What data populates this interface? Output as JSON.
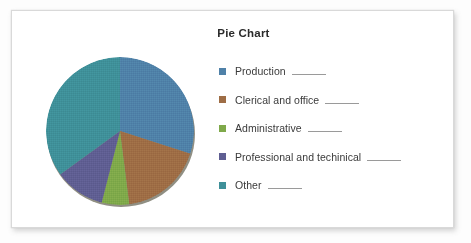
{
  "card": {
    "title": "Pie Chart"
  },
  "legend": {
    "blank": " ",
    "items": [
      {
        "label": "Production",
        "color": "#4F81A8"
      },
      {
        "label": "Clerical and office",
        "color": "#9E6D45"
      },
      {
        "label": "Administrative",
        "color": "#7FA94A"
      },
      {
        "label": "Professional and techinical",
        "color": "#5F5E92"
      },
      {
        "label": "Other",
        "color": "#3F9099"
      }
    ]
  },
  "chart_data": {
    "type": "pie",
    "title": "Pie Chart",
    "xlabel": "",
    "ylabel": "",
    "legend_position": "right",
    "grid": false,
    "start_angle_deg": 0,
    "direction": "clockwise",
    "labels": [
      "Production",
      "Clerical and office",
      "Administrative",
      "Professional and techinical",
      "Other"
    ],
    "values": [
      30,
      18,
      6,
      11,
      35
    ],
    "units": "percent",
    "value_labels_shown": false,
    "colors": [
      "#4F81A8",
      "#9E6D45",
      "#7FA94A",
      "#5F5E92",
      "#3F9099"
    ]
  }
}
